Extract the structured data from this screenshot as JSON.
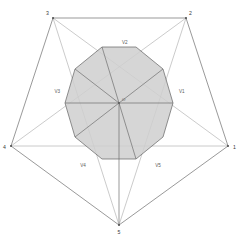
{
  "figure": {
    "background_color": "#ffffff",
    "outer_stroke": "#666666",
    "diagonal_stroke": "#9a9a9a",
    "inner_stroke": "#6b6b6b",
    "inner_fill": "#cfcfcf",
    "spoke_stroke": "#7a7a7a",
    "label_color": "#3a3a3a"
  },
  "outer_vertices": [
    {
      "id": "v1",
      "label": "1",
      "x": 228,
      "y": 146,
      "label_x": 233,
      "label_y": 149
    },
    {
      "id": "v2",
      "label": "2",
      "x": 186,
      "y": 18,
      "label_x": 189,
      "label_y": 15
    },
    {
      "id": "v3",
      "label": "3",
      "x": 53,
      "y": 18,
      "label_x": 49,
      "label_y": 15
    },
    {
      "id": "v4",
      "label": "4",
      "x": 11,
      "y": 146,
      "label_x": 6,
      "label_y": 149
    },
    {
      "id": "v5",
      "label": "5",
      "x": 119,
      "y": 225,
      "label_x": 119,
      "label_y": 233
    }
  ],
  "inner_vertices": [
    {
      "id": "iv1",
      "label": "V1",
      "label_x": 179,
      "label_y": 93
    },
    {
      "id": "iv2",
      "label": "V2",
      "label_x": 122,
      "label_y": 44
    },
    {
      "id": "iv3",
      "label": "V3",
      "label_x": 60,
      "label_y": 93
    },
    {
      "id": "iv4",
      "label": "V4",
      "label_x": 83,
      "label_y": 166
    },
    {
      "id": "iv5",
      "label": "V5",
      "label_x": 158,
      "label_y": 166
    }
  ],
  "center": {
    "id": "origin",
    "label": "O",
    "x": 119,
    "y": 103,
    "label_x": 121,
    "label_y": 101
  },
  "geometry": {
    "type": "polygon-diagram",
    "outer_shape": "pentagon",
    "outer_sides": 5,
    "diagonals_drawn": 5,
    "inner_shape": "decagon",
    "inner_sides": 10,
    "spokes": 5,
    "inner_labeled_points": 5
  }
}
